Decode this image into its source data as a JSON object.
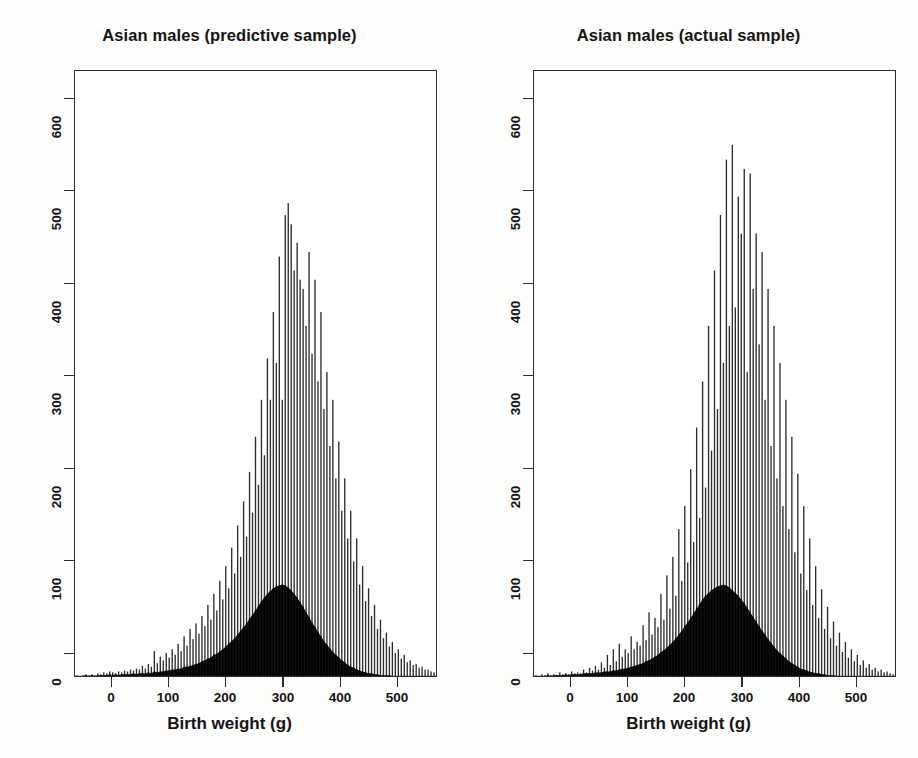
{
  "figure": {
    "background_color": "#fdfdfc",
    "ink_color": "#2c2c2c",
    "panel_count": 2
  },
  "panels": [
    {
      "id": "predictive",
      "title": "Asian males (predictive sample)"
    },
    {
      "id": "actual",
      "title": "Asian males (actual sample)"
    }
  ],
  "axes": {
    "xlabel": "Birth weight (g)",
    "ylabel": "",
    "xticks": [
      0,
      100,
      200,
      300,
      400,
      500
    ],
    "xtick_labels": [
      "0",
      "100",
      "200",
      "300",
      "400",
      "500"
    ],
    "yticks": [
      0,
      100,
      200,
      300,
      400,
      500,
      600
    ],
    "ytick_labels": [
      "0",
      "100",
      "200",
      "300",
      "400",
      "500",
      "600"
    ],
    "xlim": [
      -60,
      550
    ],
    "ylim": [
      0,
      657
    ],
    "grid": false,
    "frame": true
  },
  "chart_data": [
    {
      "type": "bar",
      "id": "predictive",
      "title": "Asian males (predictive sample)",
      "xlabel": "Birth weight (g)",
      "ylabel": "",
      "xlim": [
        -60,
        550
      ],
      "ylim": [
        0,
        657
      ],
      "grid": false,
      "legend": "none",
      "bin_width": 5,
      "note": "Two overlaid histograms: tall open/spiky series and dense solid-black series",
      "x": [
        -55,
        -50,
        -45,
        -40,
        -35,
        -30,
        -25,
        -20,
        -15,
        -10,
        -5,
        0,
        5,
        10,
        15,
        20,
        25,
        30,
        35,
        40,
        45,
        50,
        55,
        60,
        65,
        70,
        75,
        80,
        85,
        90,
        95,
        100,
        105,
        110,
        115,
        120,
        125,
        130,
        135,
        140,
        145,
        150,
        155,
        160,
        165,
        170,
        175,
        180,
        185,
        190,
        195,
        200,
        205,
        210,
        215,
        220,
        225,
        230,
        235,
        240,
        245,
        250,
        255,
        260,
        265,
        270,
        275,
        280,
        285,
        290,
        295,
        300,
        305,
        310,
        315,
        320,
        325,
        330,
        335,
        340,
        345,
        350,
        355,
        360,
        365,
        370,
        375,
        380,
        385,
        390,
        395,
        400,
        405,
        410,
        415,
        420,
        425,
        430,
        435,
        440,
        445,
        450,
        455,
        460,
        465,
        470,
        475,
        480,
        485,
        490,
        495,
        500,
        505,
        510,
        515,
        520,
        525,
        530,
        535,
        540,
        545
      ],
      "series": [
        {
          "name": "spiky",
          "values": [
            2,
            1,
            2,
            3,
            2,
            3,
            2,
            4,
            3,
            5,
            4,
            6,
            5,
            4,
            6,
            5,
            7,
            6,
            8,
            7,
            9,
            8,
            12,
            9,
            14,
            11,
            28,
            15,
            22,
            18,
            26,
            21,
            30,
            24,
            36,
            28,
            44,
            34,
            52,
            41,
            58,
            47,
            66,
            55,
            78,
            62,
            90,
            72,
            104,
            84,
            120,
            96,
            140,
            112,
            164,
            130,
            190,
            152,
            222,
            178,
            260,
            208,
            300,
            240,
            345,
            300,
            395,
            340,
            455,
            300,
            500,
            513,
            490,
            440,
            470,
            430,
            420,
            380,
            460,
            350,
            430,
            320,
            395,
            290,
            330,
            250,
            300,
            215,
            255,
            180,
            215,
            150,
            180,
            125,
            150,
            100,
            120,
            82,
            96,
            66,
            78,
            52,
            62,
            42,
            48,
            33,
            38,
            26,
            30,
            20,
            24,
            16,
            18,
            13,
            14,
            10,
            11,
            8,
            8,
            6,
            5
          ]
        },
        {
          "name": "solid",
          "values": [
            1,
            1,
            1,
            2,
            1,
            2,
            1,
            2,
            2,
            2,
            2,
            3,
            2,
            3,
            2,
            3,
            3,
            3,
            3,
            4,
            3,
            4,
            4,
            4,
            5,
            4,
            6,
            5,
            6,
            6,
            7,
            7,
            8,
            8,
            9,
            9,
            11,
            11,
            12,
            13,
            14,
            15,
            17,
            18,
            20,
            21,
            24,
            25,
            28,
            30,
            33,
            36,
            39,
            42,
            46,
            50,
            54,
            58,
            63,
            67,
            72,
            77,
            82,
            86,
            90,
            93,
            96,
            98,
            99,
            100,
            99,
            97,
            94,
            90,
            86,
            81,
            76,
            70,
            65,
            59,
            54,
            49,
            44,
            39,
            35,
            31,
            27,
            24,
            21,
            18,
            16,
            13,
            11,
            10,
            8,
            7,
            6,
            5,
            4,
            4,
            3,
            3,
            2,
            2,
            2,
            2,
            1,
            1,
            1,
            1,
            1,
            1,
            1,
            1,
            1,
            1,
            1,
            1,
            1,
            1,
            1
          ]
        }
      ]
    },
    {
      "type": "bar",
      "id": "actual",
      "title": "Asian males (actual sample)",
      "xlabel": "Birth weight (g)",
      "ylabel": "",
      "xlim": [
        -60,
        550
      ],
      "ylim": [
        0,
        657
      ],
      "grid": false,
      "legend": "none",
      "bin_width": 5,
      "note": "Two overlaid histograms: tall open/spiky series and dense solid-black series",
      "x": [
        -55,
        -50,
        -45,
        -40,
        -35,
        -30,
        -25,
        -20,
        -15,
        -10,
        -5,
        0,
        5,
        10,
        15,
        20,
        25,
        30,
        35,
        40,
        45,
        50,
        55,
        60,
        65,
        70,
        75,
        80,
        85,
        90,
        95,
        100,
        105,
        110,
        115,
        120,
        125,
        130,
        135,
        140,
        145,
        150,
        155,
        160,
        165,
        170,
        175,
        180,
        185,
        190,
        195,
        200,
        205,
        210,
        215,
        220,
        225,
        230,
        235,
        240,
        245,
        250,
        255,
        260,
        265,
        270,
        275,
        280,
        285,
        290,
        295,
        300,
        305,
        310,
        315,
        320,
        325,
        330,
        335,
        340,
        345,
        350,
        355,
        360,
        365,
        370,
        375,
        380,
        385,
        390,
        395,
        400,
        405,
        410,
        415,
        420,
        425,
        430,
        435,
        440,
        445,
        450,
        455,
        460,
        465,
        470,
        475,
        480,
        485,
        490,
        495,
        500,
        505,
        510,
        515,
        520,
        525,
        530,
        535,
        540,
        545
      ],
      "series": [
        {
          "name": "spiky",
          "values": [
            2,
            1,
            3,
            2,
            4,
            2,
            3,
            2,
            5,
            3,
            4,
            3,
            6,
            4,
            5,
            4,
            8,
            5,
            10,
            7,
            12,
            8,
            16,
            10,
            24,
            13,
            30,
            17,
            36,
            22,
            30,
            26,
            44,
            30,
            38,
            34,
            56,
            40,
            70,
            46,
            64,
            54,
            90,
            62,
            110,
            74,
            130,
            88,
            160,
            104,
            185,
            124,
            225,
            146,
            270,
            172,
            320,
            205,
            380,
            245,
            440,
            290,
            500,
            340,
            560,
            380,
            576,
            400,
            520,
            480,
            550,
            330,
            545,
            420,
            480,
            360,
            460,
            300,
            420,
            250,
            380,
            215,
            340,
            185,
            300,
            160,
            260,
            135,
            220,
            112,
            185,
            94,
            150,
            78,
            120,
            64,
            95,
            52,
            76,
            42,
            60,
            34,
            48,
            27,
            38,
            21,
            30,
            17,
            24,
            13,
            18,
            10,
            14,
            8,
            10,
            6,
            8,
            5,
            6,
            4,
            3
          ]
        },
        {
          "name": "solid",
          "values": [
            1,
            1,
            1,
            1,
            2,
            1,
            2,
            2,
            2,
            2,
            3,
            2,
            3,
            3,
            3,
            3,
            4,
            4,
            4,
            4,
            5,
            5,
            5,
            6,
            6,
            6,
            7,
            7,
            8,
            9,
            9,
            10,
            11,
            12,
            13,
            14,
            15,
            17,
            18,
            20,
            22,
            24,
            27,
            29,
            32,
            35,
            38,
            42,
            46,
            50,
            55,
            59,
            64,
            69,
            74,
            79,
            84,
            88,
            91,
            94,
            96,
            98,
            99,
            100,
            99,
            97,
            94,
            91,
            88,
            84,
            80,
            75,
            70,
            65,
            60,
            55,
            50,
            46,
            41,
            37,
            33,
            29,
            26,
            23,
            20,
            17,
            15,
            13,
            11,
            9,
            8,
            7,
            6,
            5,
            4,
            4,
            3,
            3,
            2,
            2,
            2,
            1,
            1,
            1,
            1,
            1,
            1,
            1,
            1,
            1,
            1,
            1,
            1,
            1,
            1,
            1,
            1,
            1,
            1,
            1,
            1
          ]
        }
      ]
    }
  ]
}
